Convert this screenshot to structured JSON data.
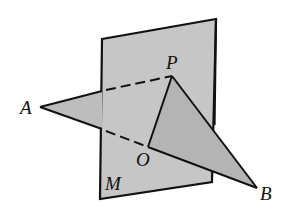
{
  "diagram": {
    "labels": {
      "plane": "M",
      "point_p": "P",
      "point_a": "A",
      "point_o": "O",
      "point_b": "B"
    },
    "colors": {
      "plane_fill": "#c4c4c4",
      "triangle_fill": "#b9b9b9",
      "stroke": "#111111",
      "background": "#ffffff"
    }
  }
}
